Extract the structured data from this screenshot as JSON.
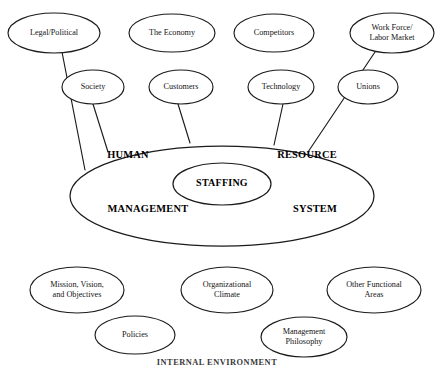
{
  "diagram": {
    "caption": "INTERNAL ENVIRONMENT",
    "colors": {
      "background": "#ffffff",
      "stroke": "#1b1b1b",
      "text": "#141414",
      "bold_text": "#000000"
    },
    "core": {
      "words": [
        {
          "text": "HUMAN",
          "x": 128,
          "y": 156
        },
        {
          "text": "RESOURCE",
          "x": 307,
          "y": 156
        },
        {
          "text": "MANAGEMENT",
          "x": 148,
          "y": 210
        },
        {
          "text": "SYSTEM",
          "x": 315,
          "y": 210
        }
      ],
      "inner": {
        "text": "STAFFING",
        "x": 222,
        "y": 184
      }
    },
    "external_nodes": [
      {
        "label_lines": [
          "Legal/Political"
        ],
        "cx": 54,
        "cy": 33,
        "rx": 46,
        "ry": 20
      },
      {
        "label_lines": [
          "The Economy"
        ],
        "cx": 172,
        "cy": 33,
        "rx": 43,
        "ry": 19
      },
      {
        "label_lines": [
          "Competitors"
        ],
        "cx": 274,
        "cy": 33,
        "rx": 40,
        "ry": 19
      },
      {
        "label_lines": [
          "Work Force/",
          "Labor Market"
        ],
        "cx": 392,
        "cy": 33,
        "rx": 42,
        "ry": 20
      },
      {
        "label_lines": [
          "Society"
        ],
        "cx": 93,
        "cy": 87,
        "rx": 31,
        "ry": 17
      },
      {
        "label_lines": [
          "Customers"
        ],
        "cx": 181,
        "cy": 87,
        "rx": 32,
        "ry": 17
      },
      {
        "label_lines": [
          "Technology"
        ],
        "cx": 281,
        "cy": 87,
        "rx": 33,
        "ry": 17
      },
      {
        "label_lines": [
          "Unions"
        ],
        "cx": 368,
        "cy": 87,
        "rx": 30,
        "ry": 17
      }
    ],
    "internal_nodes": [
      {
        "label_lines": [
          "Mission, Vision,",
          "and Objectives"
        ],
        "cx": 77,
        "cy": 290,
        "rx": 47,
        "ry": 23
      },
      {
        "label_lines": [
          "Organizational",
          "Climate"
        ],
        "cx": 227,
        "cy": 290,
        "rx": 46,
        "ry": 23
      },
      {
        "label_lines": [
          "Other Functional",
          "Areas"
        ],
        "cx": 374,
        "cy": 290,
        "rx": 47,
        "ry": 23
      },
      {
        "label_lines": [
          "Policies"
        ],
        "cx": 135,
        "cy": 335,
        "rx": 40,
        "ry": 19
      },
      {
        "label_lines": [
          "Management",
          "Philosophy"
        ],
        "cx": 304,
        "cy": 337,
        "rx": 43,
        "ry": 20
      }
    ],
    "connectors": [
      {
        "name": "legal-political-to-core",
        "x1": 62,
        "y1": 52,
        "x2": 85,
        "y2": 170
      },
      {
        "name": "society-to-core",
        "x1": 93,
        "y1": 104,
        "x2": 108,
        "y2": 152
      },
      {
        "name": "customers-to-core",
        "x1": 178,
        "y1": 104,
        "x2": 190,
        "y2": 143
      },
      {
        "name": "technology-to-core",
        "x1": 283,
        "y1": 104,
        "x2": 274,
        "y2": 145
      },
      {
        "name": "work-force-to-core",
        "x1": 375,
        "y1": 52,
        "x2": 308,
        "y2": 152
      }
    ]
  }
}
